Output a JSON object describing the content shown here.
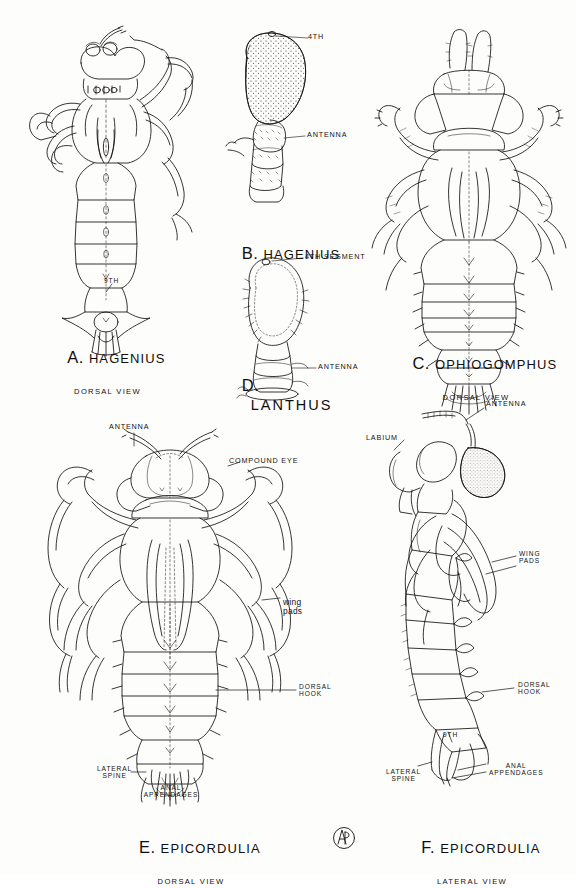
{
  "plate": {
    "medium": "pen-and-ink scientific illustration",
    "background_color": "#fdfdfc",
    "ink_color": "#14110f",
    "subject": "dragonfly nymph anatomy plate",
    "panels": [
      {
        "id": "A",
        "letter": "A.",
        "genus": "HAGENIUS",
        "view": "DORSAL VIEW",
        "labels": [
          {
            "name": "segment-9",
            "text": "9TH"
          }
        ]
      },
      {
        "id": "B",
        "letter": "B.",
        "genus": "HAGENIUS",
        "view": "",
        "labels": [
          {
            "name": "fourth-segment",
            "text": "4TH"
          },
          {
            "name": "antenna",
            "text": "ANTENNA"
          }
        ]
      },
      {
        "id": "C",
        "letter": "C.",
        "genus": "OPHIOGOMPHUS",
        "view": "DORSAL VIEW",
        "labels": []
      },
      {
        "id": "D",
        "letter": "D.",
        "genus": "LANTHUS",
        "view": "",
        "labels": [
          {
            "name": "fourth-segment",
            "text": "4TH SEGMENT"
          },
          {
            "name": "antenna",
            "text": "ANTENNA"
          }
        ]
      },
      {
        "id": "E",
        "letter": "E.",
        "genus": "EPICORDULIA",
        "view": "DORSAL VIEW",
        "labels": [
          {
            "name": "antenna",
            "text": "ANTENNA"
          },
          {
            "name": "compound-eye",
            "text": "COMPOUND EYE"
          },
          {
            "name": "wing-pads",
            "text": "wing\npads"
          },
          {
            "name": "dorsal-hook",
            "text": "DORSAL\nHOOK"
          },
          {
            "name": "lateral-spine",
            "text": "LATERAL\nSPINE"
          },
          {
            "name": "anal-appendages",
            "text": "ANAL\nAPPENDAGES"
          }
        ]
      },
      {
        "id": "F",
        "letter": "F.",
        "genus": "EPICORDULIA",
        "view": "LATERAL VIEW",
        "labels": [
          {
            "name": "antenna",
            "text": "ANTENNA"
          },
          {
            "name": "labium",
            "text": "LABIUM"
          },
          {
            "name": "wing-pads",
            "text": "WING\nPADS"
          },
          {
            "name": "dorsal-hook",
            "text": "DORSAL\nHOOK"
          },
          {
            "name": "segment-9",
            "text": "9TH"
          },
          {
            "name": "lateral-spine",
            "text": "LATERAL\nSPINE"
          },
          {
            "name": "anal-appendages",
            "text": "ANAL\nAPPENDAGES"
          }
        ]
      }
    ],
    "monogram": {
      "name": "artist-monogram",
      "text": "AP"
    }
  }
}
